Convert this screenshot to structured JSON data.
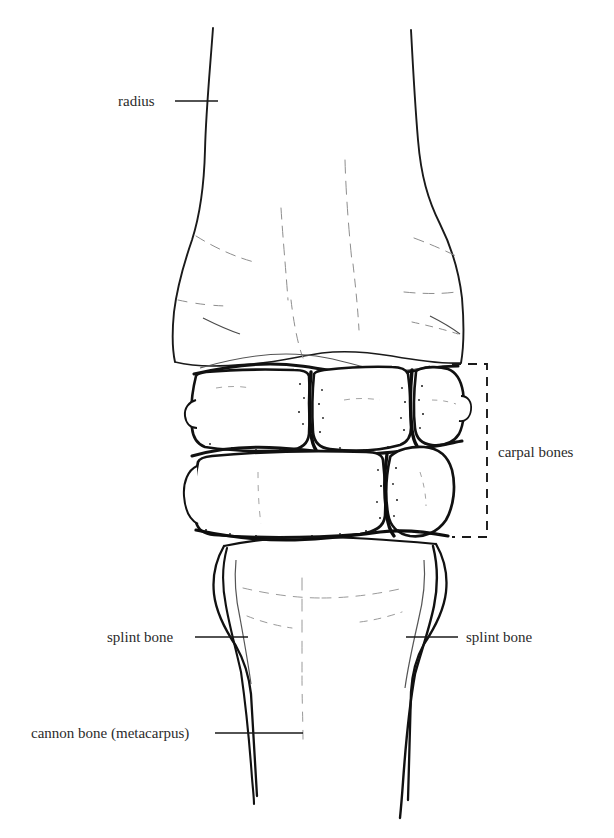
{
  "figure": {
    "line_color": "#1a1a1a",
    "faint_line_color": "#8a8a8a",
    "text_color": "#2b2b2b",
    "background": "#ffffff"
  },
  "labels": {
    "radius": "radius",
    "carpal_bones": "carpal bones",
    "splint_bone_left": "splint bone",
    "splint_bone_right": "splint bone",
    "cannon_bone": "cannon bone (metacarpus)"
  },
  "annotations": {
    "leader_radius": {
      "x1": 175,
      "y1": 101,
      "x2": 218,
      "y2": 101
    },
    "leader_splint_left": {
      "x1": 195,
      "y1": 637,
      "x2": 248,
      "y2": 637
    },
    "leader_splint_right": {
      "x1": 406,
      "y1": 637,
      "x2": 458,
      "y2": 637
    },
    "leader_cannon": {
      "x1": 215,
      "y1": 733,
      "x2": 303,
      "y2": 733
    },
    "carpal_bracket": {
      "x_left": 452,
      "x_right": 487,
      "y_top": 364,
      "y_bottom": 537,
      "style": "dashed"
    }
  },
  "structures": [
    {
      "name": "radius",
      "region": "top",
      "y_range": [
        28,
        366
      ]
    },
    {
      "name": "proximal-carpal-row",
      "region": "upper-middle",
      "y_range": [
        360,
        448
      ],
      "bone_count": 4
    },
    {
      "name": "distal-carpal-row",
      "region": "lower-middle",
      "y_range": [
        445,
        538
      ],
      "bone_count": 3
    },
    {
      "name": "cannon-bone-metacarpus",
      "region": "bottom",
      "y_range": [
        533,
        812
      ]
    },
    {
      "name": "splint-bone-left",
      "region": "bottom-left",
      "y_range": [
        545,
        800
      ]
    },
    {
      "name": "splint-bone-right",
      "region": "bottom-right",
      "y_range": [
        545,
        825
      ]
    }
  ]
}
